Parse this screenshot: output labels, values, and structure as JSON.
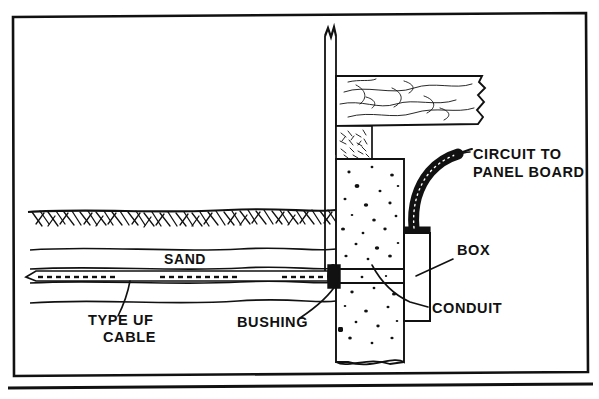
{
  "figure": {
    "kind": "technical-line-drawing",
    "line_color": "#111111",
    "background_color": "#ffffff"
  },
  "border": {
    "name": "drawing-frame",
    "baseline_rule": true
  },
  "labels": {
    "circuit_to_panel_board": {
      "line1": "CIRCUIT TO",
      "line2": "PANEL BOARD"
    },
    "box": "BOX",
    "conduit": "CONDUIT",
    "sand": "SAND",
    "bushing": "BUSHING",
    "type_uf_cable": {
      "line1": "TYPE  UF",
      "line2": "CABLE"
    }
  },
  "components": {
    "stud": "wall-stud",
    "siding": "wood-siding-board",
    "sill": "sill-plate-mortar",
    "foundation": "concrete-foundation-wall",
    "earth": "earth-hatching",
    "sand_bed": "sand-bedding",
    "cable": "type-uf-cable",
    "bushing": "cable-bushing",
    "conduit": "conduit-through-wall",
    "box": "outlet-box",
    "flex": "flexible-armored-conduit"
  }
}
